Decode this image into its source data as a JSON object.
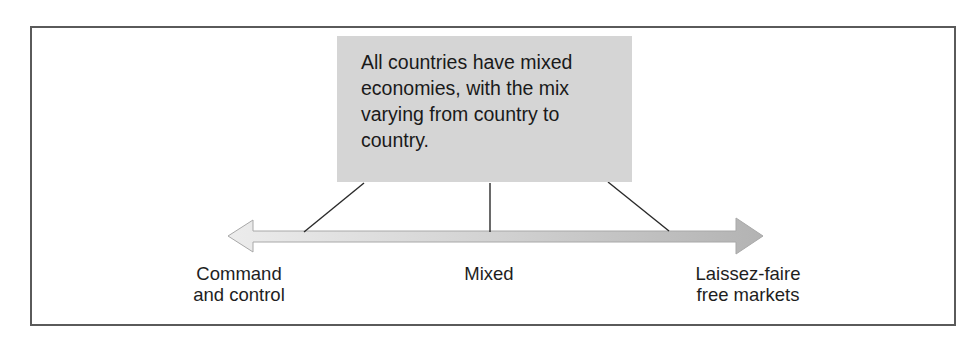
{
  "diagram": {
    "callout": {
      "text": "All countries have mixed economies, with the mix varying from country to country.",
      "lines": [
        "All countries have mixed",
        "economies, with the mix",
        "varying from country to",
        "country."
      ],
      "fill_color": "#d5d5d5"
    },
    "spectrum": {
      "type": "double-headed-arrow",
      "gradient": [
        "#ebebeb",
        "#b5b5b5"
      ],
      "labels": {
        "left": {
          "lines": [
            "Command",
            "and control"
          ]
        },
        "middle": {
          "lines": [
            "Mixed"
          ]
        },
        "right": {
          "lines": [
            "Laissez-faire",
            "free markets"
          ]
        }
      }
    },
    "connectors": [
      {
        "name": "connector-left",
        "from": [
          364,
          183
        ],
        "to": [
          304,
          233
        ]
      },
      {
        "name": "connector-middle",
        "from": [
          490,
          183
        ],
        "to": [
          490,
          233
        ]
      },
      {
        "name": "connector-right",
        "from": [
          608,
          182
        ],
        "to": [
          669,
          232
        ]
      }
    ],
    "frame_color": "#5a5a5a"
  }
}
